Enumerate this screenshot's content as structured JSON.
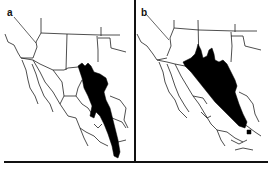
{
  "figure": {
    "panels": [
      {
        "id": "a",
        "label": "a",
        "description": "Distribution map, southwestern USA and Mexico; range shaded black along eastern Mexico"
      },
      {
        "id": "b",
        "label": "b",
        "description": "Distribution map, southwestern USA and Mexico; range shaded black across north-central Mexico tapering southeast"
      }
    ],
    "colors": {
      "background": "#ffffff",
      "range_fill": "#000000",
      "border_lines": "#222222"
    }
  }
}
